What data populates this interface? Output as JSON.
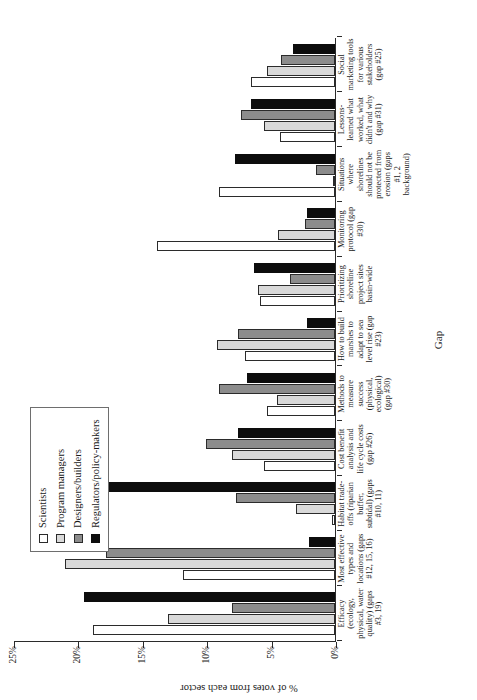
{
  "chart_data": {
    "type": "bar",
    "title": "",
    "subtitle": "",
    "xlabel": "Gap",
    "ylabel": "% of votes from each sector",
    "ylim": [
      0,
      25
    ],
    "yticks": [
      "0%",
      "5%",
      "10%",
      "15%",
      "20%",
      "25%"
    ],
    "ytick_values": [
      0,
      5,
      10,
      15,
      20,
      25
    ],
    "grid": false,
    "legend_position": "top-left",
    "orientation": "vertical-bars-on-rotated-page",
    "categories": [
      "Efficacy (ecology, physical, water quality) (gaps #3, 19)",
      "Most effective types and locations (gaps #12, 15, 16)",
      "Habitat trade-offs (riparian buffer, subtidal) (gaps #10, 11)",
      "Cost benefit analysis and life cycle costs (gap #26)",
      "Methods to measure success (physical, ecological) (gap #30)",
      "How to build marshes to adapt to sea level rise (gap #23)",
      "Prioritizing shoreline project sites basin-wide",
      "Monitoring protocol (gap #30)",
      "Situations where shorelines should not be protected from erosion (gaps #1, 2 background)",
      "Lessons-learned what worked, what didn't and why (gap #31)",
      "Social marketing tools for various stakeholders (gap #25)"
    ],
    "series": [
      {
        "name": "Scientists",
        "color": "#ffffff",
        "values": [
          18.8,
          11.8,
          0.2,
          5.5,
          5.3,
          7.0,
          5.8,
          13.8,
          9.0,
          4.3,
          6.5
        ]
      },
      {
        "name": "Program managers",
        "color": "#d9d9d9",
        "values": [
          13.0,
          21.0,
          3.0,
          8.0,
          4.5,
          9.2,
          6.0,
          4.4,
          0.0,
          5.5,
          5.3
        ]
      },
      {
        "name": "Designers/builders",
        "color": "#8c8c8c",
        "values": [
          8.0,
          17.8,
          7.7,
          10.0,
          9.0,
          7.5,
          3.5,
          2.3,
          1.5,
          7.3,
          4.2
        ]
      },
      {
        "name": "Regulators/policy-makers",
        "color": "#0d0d0d",
        "values": [
          19.5,
          2.0,
          20.5,
          7.5,
          6.8,
          2.2,
          6.3,
          2.2,
          7.8,
          6.5,
          3.3
        ]
      }
    ]
  },
  "legend": {
    "items": [
      {
        "label": "Scientists",
        "swatch": "open-square-white"
      },
      {
        "label": "Program managers",
        "swatch": "filled-square-light-gray"
      },
      {
        "label": "Designers/builders",
        "swatch": "filled-square-dark-gray"
      },
      {
        "label": "Regulators/policy-makers",
        "swatch": "filled-square-black"
      }
    ]
  }
}
